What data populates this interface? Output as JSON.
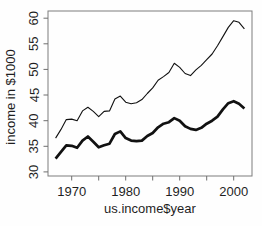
{
  "chart_data": {
    "type": "line",
    "title": "",
    "xlabel": "us.income$year",
    "ylabel": "income in $1000",
    "x": [
      1967,
      1968,
      1969,
      1970,
      1971,
      1972,
      1973,
      1974,
      1975,
      1976,
      1977,
      1978,
      1979,
      1980,
      1981,
      1982,
      1983,
      1984,
      1985,
      1986,
      1987,
      1988,
      1989,
      1990,
      1991,
      1992,
      1993,
      1994,
      1995,
      1996,
      1997,
      1998,
      1999,
      2000,
      2001,
      2002
    ],
    "series": [
      {
        "name": "thin-line",
        "stroke_width": 1.1,
        "values": [
          36.6,
          38.3,
          40.2,
          40.3,
          40.0,
          41.9,
          42.6,
          41.8,
          40.8,
          41.8,
          41.9,
          44.2,
          44.8,
          43.6,
          43.3,
          43.5,
          44.1,
          45.3,
          46.4,
          47.9,
          48.6,
          49.4,
          51.2,
          50.4,
          49.2,
          48.8,
          49.9,
          50.8,
          51.9,
          53.0,
          54.6,
          56.4,
          58.2,
          59.5,
          59.2,
          57.9
        ]
      },
      {
        "name": "thick-line",
        "stroke_width": 2.7,
        "values": [
          32.6,
          33.9,
          35.2,
          35.1,
          34.7,
          36.1,
          36.9,
          35.9,
          34.8,
          35.2,
          35.5,
          37.4,
          37.9,
          36.6,
          36.1,
          36.0,
          36.1,
          37.0,
          37.6,
          38.7,
          39.4,
          39.7,
          40.5,
          40.0,
          38.9,
          38.4,
          38.2,
          38.6,
          39.4,
          40.0,
          40.8,
          42.2,
          43.4,
          43.8,
          43.3,
          42.4
        ]
      }
    ],
    "xlim": [
      1965.6,
      2003.4
    ],
    "ylim": [
      29.2,
      61.4
    ],
    "x_ticks": [
      1970,
      1975,
      1980,
      1985,
      1990,
      1995,
      2000
    ],
    "x_tick_label_positions": [
      1970,
      1980,
      1990,
      2000
    ],
    "x_tick_labels": [
      "1970",
      "1980",
      "1990",
      "2000"
    ],
    "y_ticks": [
      30,
      35,
      40,
      45,
      50,
      55,
      60
    ],
    "y_tick_labels": [
      "30",
      "35",
      "40",
      "45",
      "50",
      "55",
      "60"
    ],
    "grid": false,
    "legend": "none",
    "colors": {
      "line": "#111111",
      "box": "#7d7d7d",
      "tick": "#6e6e6e",
      "text": "#1f1f1f",
      "background": "#fefefe"
    }
  }
}
